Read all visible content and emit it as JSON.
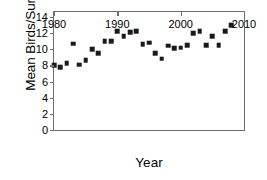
{
  "chart_data": {
    "type": "scatter",
    "title": "",
    "xlabel": "Year",
    "ylabel": "Mean Birds/Survey",
    "xlim": [
      1980,
      2010
    ],
    "ylim": [
      0,
      14.6
    ],
    "xticks": [
      1980,
      1990,
      2000,
      2010
    ],
    "yticks": [
      0,
      2,
      4,
      6,
      8,
      10,
      12,
      14
    ],
    "grid": false,
    "legend": null,
    "marker_color": "#1a1a1a",
    "marker_shape": "square",
    "axis_color": "#6e6e6e",
    "x": [
      1980,
      1981,
      1982,
      1983,
      1984,
      1985,
      1986,
      1987,
      1988,
      1989,
      1990,
      1991,
      1992,
      1993,
      1994,
      1995,
      1996,
      1997,
      1998,
      1999,
      2000,
      2001,
      2002,
      2003,
      2004,
      2005,
      2006,
      2007,
      2008
    ],
    "values": [
      8.0,
      7.8,
      8.3,
      10.7,
      8.1,
      8.6,
      10.0,
      9.5,
      11.0,
      11.0,
      12.2,
      11.6,
      12.1,
      12.25,
      10.6,
      10.8,
      9.5,
      8.8,
      10.45,
      10.1,
      10.2,
      10.5,
      12.0,
      12.25,
      10.5,
      11.6,
      10.5,
      12.2,
      13.0
    ],
    "series": [
      {
        "name": "Mean Birds/Survey",
        "points": [
          {
            "x": 1980,
            "y": 8.0
          },
          {
            "x": 1981,
            "y": 7.8
          },
          {
            "x": 1982,
            "y": 8.3
          },
          {
            "x": 1983,
            "y": 10.7
          },
          {
            "x": 1984,
            "y": 8.1
          },
          {
            "x": 1985,
            "y": 8.6
          },
          {
            "x": 1986,
            "y": 10.0
          },
          {
            "x": 1987,
            "y": 9.5
          },
          {
            "x": 1988,
            "y": 11.0
          },
          {
            "x": 1989,
            "y": 11.0
          },
          {
            "x": 1990,
            "y": 12.2
          },
          {
            "x": 1991,
            "y": 11.6
          },
          {
            "x": 1992,
            "y": 12.1
          },
          {
            "x": 1993,
            "y": 12.25
          },
          {
            "x": 1994,
            "y": 10.6
          },
          {
            "x": 1995,
            "y": 10.8
          },
          {
            "x": 1996,
            "y": 9.5
          },
          {
            "x": 1997,
            "y": 8.8
          },
          {
            "x": 1998,
            "y": 10.45
          },
          {
            "x": 1999,
            "y": 10.1
          },
          {
            "x": 2000,
            "y": 10.2
          },
          {
            "x": 2001,
            "y": 10.5
          },
          {
            "x": 2002,
            "y": 12.0
          },
          {
            "x": 2003,
            "y": 12.25
          },
          {
            "x": 2004,
            "y": 10.5
          },
          {
            "x": 2005,
            "y": 11.6
          },
          {
            "x": 2006,
            "y": 10.5
          },
          {
            "x": 2007,
            "y": 12.2
          },
          {
            "x": 2008,
            "y": 13.0
          }
        ]
      }
    ]
  }
}
